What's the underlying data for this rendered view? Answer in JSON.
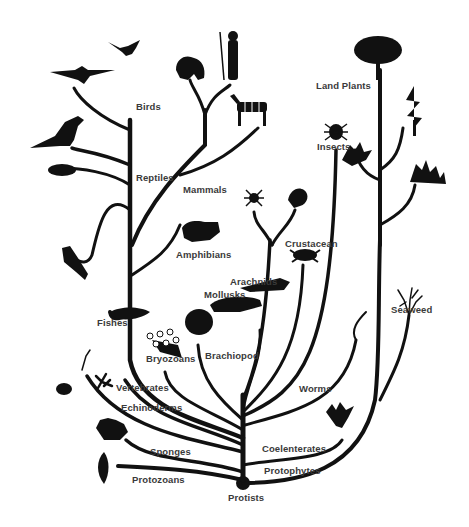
{
  "diagram": {
    "type": "phylogenetic-tree",
    "root_label": "Protists",
    "labels": {
      "birds": "Birds",
      "reptiles": "Reptiles",
      "mammals": "Mammals",
      "amphibians": "Amphibians",
      "fishes": "Fishes",
      "vertebrates": "Vertebrates",
      "echinoderms": "Echinoderms",
      "sponges": "Sponges",
      "protozoans": "Protozoans",
      "protists": "Protists",
      "bryozoans": "Bryozoans",
      "brachiopod": "Brachiopod",
      "mollusks": "Mollusks",
      "arachnids": "Arachnids",
      "crustacean": "Crustacean",
      "insects": "Insects",
      "land_plants": "Land Plants",
      "seaweed": "Seaweed",
      "worms": "Worms",
      "coelenterates": "Coelenterates",
      "protophytes": "Protophytes"
    },
    "icons": [
      "bird-icon",
      "pterosaur-icon",
      "dinosaur-icon",
      "turtle-icon",
      "gorilla-icon",
      "human-icon",
      "zebra-icon",
      "frog-icon",
      "lizard-icon",
      "fish-icon",
      "spider-icon",
      "scorpion-icon",
      "crab-icon",
      "beetle-icon",
      "fern-icon",
      "tree-icon",
      "conifer-icon",
      "moss-icon",
      "seaweed-icon",
      "squid-icon",
      "snail-icon",
      "brachiopod-shell-icon",
      "bryozoan-icon",
      "starfish-icon",
      "sea-urchin-icon",
      "sponge-icon",
      "protozoan-icon",
      "jellyfish-icon",
      "worm-icon"
    ],
    "colors": {
      "branch": "#111111",
      "label": "#3a3a3a",
      "background": "#ffffff"
    }
  }
}
